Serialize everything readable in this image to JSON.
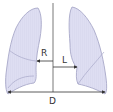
{
  "diagram": {
    "labels": {
      "right_measure": "R",
      "left_measure": "L",
      "diameter": "D"
    },
    "colors": {
      "lung_fill": "#dcdcf0",
      "lung_stroke": "#a8a8c8",
      "line": "#444444",
      "background": "#ffffff"
    }
  }
}
